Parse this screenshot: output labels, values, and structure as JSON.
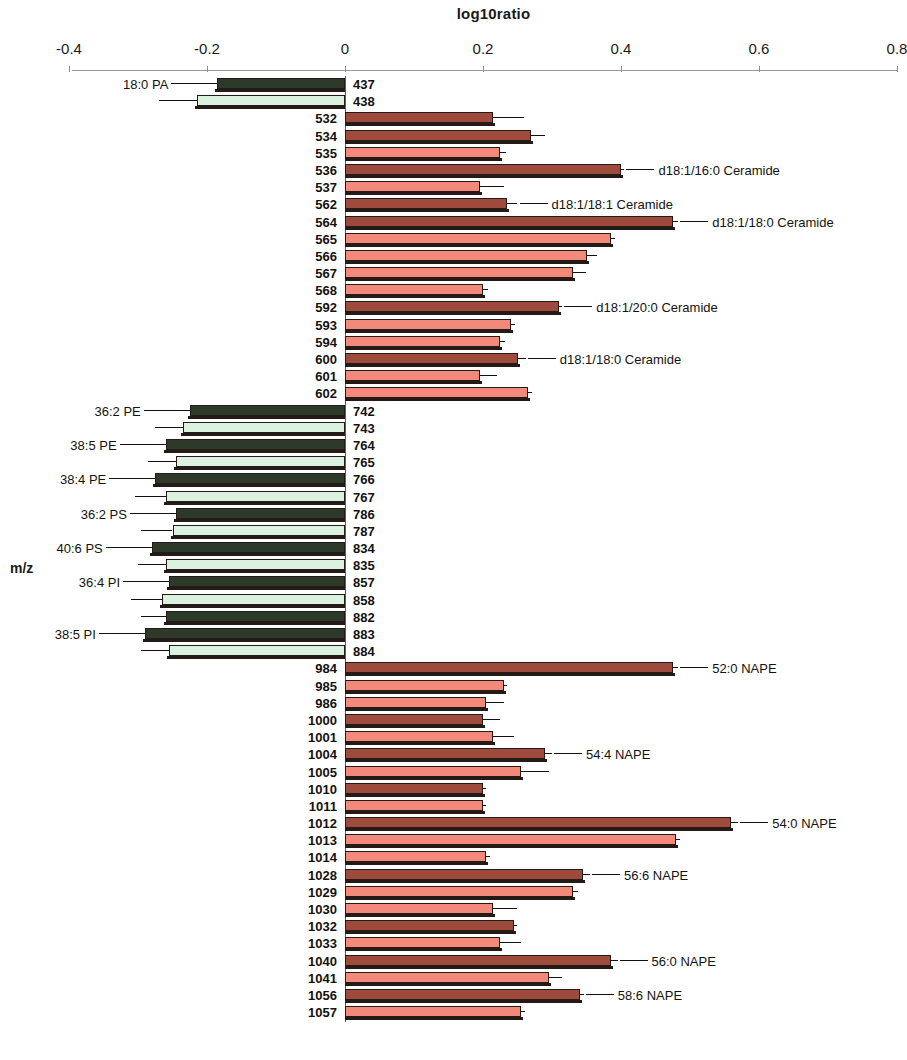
{
  "chart": {
    "title": "log10ratio",
    "y_axis_label": "m/z",
    "x_tick_labels": [
      "-0.4",
      "-0.2",
      "0",
      "0.2",
      "0.4",
      "0.6",
      "0.8"
    ]
  },
  "chart_data": {
    "type": "bar",
    "orientation": "horizontal",
    "title": "log10ratio",
    "xlabel": "log10ratio",
    "ylabel": "m/z",
    "xlim": [
      -0.4,
      0.8
    ],
    "xticks": [
      -0.4,
      -0.2,
      0,
      0.2,
      0.4,
      0.6,
      0.8
    ],
    "grid": false,
    "legend": null,
    "colors": {
      "positive_dark": "#9e4a3c",
      "positive_light": "#f2897b",
      "negative_dark": "#2d3a2a",
      "negative_light": "#dbf2e0",
      "outline": "#241a16",
      "axis": "#8e8e8e"
    },
    "series_note": "Alternating dark / light bars per m/z channel with standard-error whiskers",
    "categories": [
      "437",
      "438",
      "532",
      "534",
      "535",
      "536",
      "537",
      "562",
      "564",
      "565",
      "566",
      "567",
      "568",
      "592",
      "593",
      "594",
      "600",
      "601",
      "602",
      "742",
      "743",
      "764",
      "765",
      "766",
      "767",
      "786",
      "787",
      "834",
      "835",
      "857",
      "858",
      "882",
      "883",
      "884",
      "984",
      "985",
      "986",
      "1000",
      "1001",
      "1004",
      "1005",
      "1010",
      "1011",
      "1012",
      "1013",
      "1014",
      "1028",
      "1029",
      "1030",
      "1032",
      "1033",
      "1040",
      "1041",
      "1056",
      "1057"
    ],
    "values": [
      -0.185,
      -0.215,
      0.215,
      0.27,
      0.225,
      0.4,
      0.195,
      0.235,
      0.475,
      0.385,
      0.35,
      0.33,
      0.2,
      0.31,
      0.24,
      0.225,
      0.25,
      0.195,
      0.265,
      -0.225,
      -0.235,
      -0.26,
      -0.245,
      -0.275,
      -0.26,
      -0.245,
      -0.25,
      -0.28,
      -0.26,
      -0.255,
      -0.265,
      -0.26,
      -0.29,
      -0.255,
      0.475,
      0.23,
      0.205,
      0.2,
      0.215,
      0.29,
      0.255,
      0.2,
      0.2,
      0.56,
      0.48,
      0.205,
      0.345,
      0.33,
      0.215,
      0.245,
      0.225,
      0.385,
      0.295,
      0.34,
      0.255
    ],
    "errors": [
      0.04,
      0.055,
      0.045,
      0.02,
      0.008,
      0.005,
      0.035,
      0.015,
      0.008,
      0.006,
      0.015,
      0.02,
      0.007,
      0.005,
      0.007,
      0.007,
      0.012,
      0.025,
      0.006,
      0.045,
      0.04,
      0.03,
      0.04,
      0.035,
      0.045,
      0.03,
      0.045,
      0.04,
      0.04,
      0.035,
      0.045,
      0.035,
      0.04,
      0.04,
      0.008,
      0.005,
      0.025,
      0.025,
      0.03,
      0.01,
      0.04,
      0.005,
      0.005,
      0.01,
      0.005,
      0.005,
      0.01,
      0.007,
      0.035,
      0.005,
      0.03,
      0.01,
      0.02,
      0.006,
      0.006
    ],
    "bar_shade": [
      "dark",
      "light",
      "dark",
      "dark",
      "light",
      "dark",
      "light",
      "dark",
      "dark",
      "light",
      "light",
      "light",
      "light",
      "dark",
      "light",
      "light",
      "dark",
      "light",
      "light",
      "dark",
      "light",
      "dark",
      "light",
      "dark",
      "light",
      "dark",
      "light",
      "dark",
      "light",
      "dark",
      "light",
      "dark",
      "dark",
      "light",
      "dark",
      "light",
      "light",
      "dark",
      "light",
      "dark",
      "light",
      "dark",
      "light",
      "dark",
      "light",
      "light",
      "dark",
      "light",
      "light",
      "dark",
      "light",
      "dark",
      "light",
      "dark",
      "light"
    ],
    "annotations": [
      {
        "category": "18:0 PA",
        "for_mz": "437",
        "side": "left"
      },
      {
        "category": "d18:1/16:0 Ceramide",
        "for_mz": "536",
        "side": "right"
      },
      {
        "category": "d18:1/18:1 Ceramide",
        "for_mz": "562",
        "side": "right"
      },
      {
        "category": "d18:1/18:0 Ceramide",
        "for_mz": "564",
        "side": "right"
      },
      {
        "category": "d18:1/20:0 Ceramide",
        "for_mz": "592",
        "side": "right"
      },
      {
        "category": "d18:1/18:0 Ceramide",
        "for_mz": "600",
        "side": "right"
      },
      {
        "category": "36:2 PE",
        "for_mz": "742",
        "side": "left"
      },
      {
        "category": "38:5 PE",
        "for_mz": "764",
        "side": "left"
      },
      {
        "category": "38:4 PE",
        "for_mz": "766",
        "side": "left"
      },
      {
        "category": "36:2 PS",
        "for_mz": "786",
        "side": "left"
      },
      {
        "category": "40:6 PS",
        "for_mz": "834",
        "side": "left"
      },
      {
        "category": "36:4 PI",
        "for_mz": "857",
        "side": "left"
      },
      {
        "category": "38:5 PI",
        "for_mz": "883",
        "side": "left"
      },
      {
        "category": "52:0 NAPE",
        "for_mz": "984",
        "side": "right"
      },
      {
        "category": "54:4 NAPE",
        "for_mz": "1004",
        "side": "right"
      },
      {
        "category": "54:0 NAPE",
        "for_mz": "1012",
        "side": "right"
      },
      {
        "category": "56:6 NAPE",
        "for_mz": "1028",
        "side": "right"
      },
      {
        "category": "56:0 NAPE",
        "for_mz": "1040",
        "side": "right"
      },
      {
        "category": "58:6 NAPE",
        "for_mz": "1056",
        "side": "right"
      }
    ]
  }
}
